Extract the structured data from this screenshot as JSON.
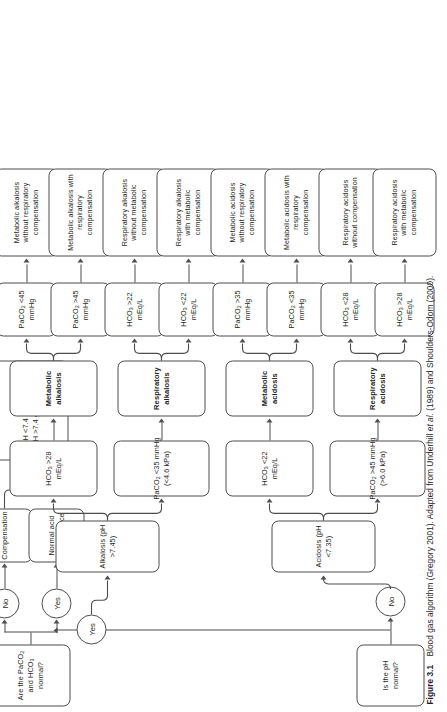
{
  "figure": {
    "number": "Figure 3.1",
    "caption_a": "Blood gas algorithm (Gregory 2001). Adapted from Underhill ",
    "caption_italic": "et al.",
    "caption_b": " (1989) and Shoulders-Odom (2000)."
  },
  "nodes": {
    "start": "Is the pH normal?",
    "ph_yes": "Yes",
    "ph_no": "No",
    "gases_normal": "Are the PaCO₂ and HCO₃ normal?",
    "gas_yes": "Yes",
    "gas_no": "No",
    "normal_balance": "Normal acid base balance",
    "compensation": "Compensation",
    "comp_rule_line1": "If pH <7.4 go to acidosis",
    "comp_rule_line2": "If pH >7.4 go to alkalosis",
    "alkalosis": "Alkalosis (pH >7.45)",
    "acidosis": "Acidosis (pH <7.35)",
    "alk_hco3_high": "HCO₃ >28 mEq/L",
    "alk_paco2_low_l1": "PaCO₂ <35 mmHg",
    "alk_paco2_low_l2": "(<4.6 kPa)",
    "acid_hco3_low": "HCO₃ <22 mEq/L",
    "acid_paco2_high_l1": "PaCO₂ >45 mmHg",
    "acid_paco2_high_l2": "(>6.0 kPa)",
    "metabolic_alkalosis": "Metabolic alkalosis",
    "respiratory_alkalosis": "Respiratory alkalosis",
    "metabolic_acidosis": "Metabolic acidosis",
    "respiratory_acidosis": "Respiratory acidosis",
    "ma_paco2_lt45": "PaCO₂ <45 mmHg",
    "ma_paco2_gt45": "PaCO₂ >45 mmHg",
    "ra_hco3_gt22": "HCO₃ >22 mEq/L",
    "ra_hco3_lt22": "HCO₃ <22 mEq/L",
    "mac_paco2_gt35": "PaCO₂ >35 mmHg",
    "mac_paco2_lt35": "PaCO₂ <35 mmHg",
    "rac_hco3_lt28": "HCO₃ <28 mEq/L",
    "rac_hco3_gt28": "HCO₃ >28 mEq/L",
    "out_ma_without": "Metabolic alkalosis without respiratory compensation",
    "out_ma_with": "Metabolic alkalosis with respiratory compensation",
    "out_ra_without": "Respiratory alkalosis without metabolic compensation",
    "out_ra_with": "Respiratory alkalosis with metabolic compensation",
    "out_mac_without": "Metabolic acidosis without respiratory compensation",
    "out_mac_with": "Metabolic acidosis with respiratory compensation",
    "out_rac_without": "Respiratory acidosis without compensation",
    "out_rac_with": "Respiratory acidosis with metabolic compensation"
  },
  "colors": {
    "stroke": "#4d4d4d",
    "text": "#231f20",
    "background": "#ffffff"
  }
}
